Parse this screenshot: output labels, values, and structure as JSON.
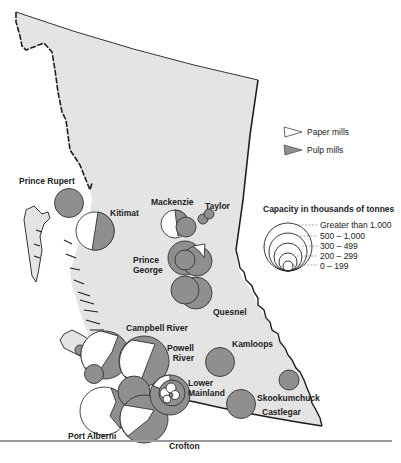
{
  "map": {
    "title": "Pulp and paper mill capacity in British Columbia",
    "colors": {
      "land": "#e4e4e4",
      "coast": "#1e1e1e",
      "pulp": "#8f8f8f",
      "paper": "#ffffff",
      "outline": "#333333"
    }
  },
  "legend": {
    "mill_types": [
      {
        "label": "Paper mills",
        "color": "#ffffff",
        "icon": "paper-mill-triangle-icon"
      },
      {
        "label": "Pulp mills",
        "color": "#8f8f8f",
        "icon": "pulp-mill-triangle-icon"
      }
    ],
    "capacity_title": "Capacity in thousands of tonnes",
    "capacity_classes": [
      {
        "label": "Greater than 1,000"
      },
      {
        "label": "500 – 1,000"
      },
      {
        "label": "300 – 499"
      },
      {
        "label": "200 – 299"
      },
      {
        "label": "0 – 199"
      }
    ]
  },
  "locations": [
    {
      "name": "Prince Rupert"
    },
    {
      "name": "Kitimat"
    },
    {
      "name": "Mackenzie"
    },
    {
      "name": "Taylor"
    },
    {
      "name": "Prince George",
      "line1": "Prince",
      "line2": "George"
    },
    {
      "name": "Quesnel"
    },
    {
      "name": "Campbell River"
    },
    {
      "name": "Powell River",
      "line1": "Powell",
      "line2": "River"
    },
    {
      "name": "Kamloops"
    },
    {
      "name": "Lower Mainland",
      "line1": "Lower",
      "line2": "Mainland"
    },
    {
      "name": "Skookumchuck"
    },
    {
      "name": "Castlegar"
    },
    {
      "name": "Port Alberni"
    },
    {
      "name": "Crofton"
    }
  ]
}
